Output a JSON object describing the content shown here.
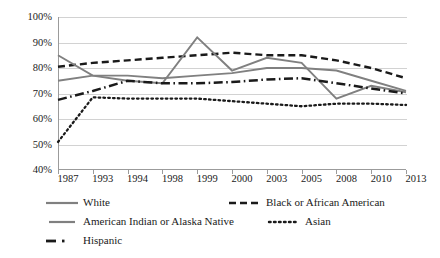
{
  "chart_data": {
    "type": "line",
    "title": "",
    "xlabel": "",
    "ylabel": "",
    "ylim": [
      40,
      100
    ],
    "ytick_labels": [
      "100%",
      "90%",
      "80%",
      "70%",
      "60%",
      "50%",
      "40%"
    ],
    "ytick_values": [
      100,
      90,
      80,
      70,
      60,
      50,
      40
    ],
    "grid": true,
    "legend_position": "bottom",
    "categories": [
      "1987",
      "1993",
      "1994",
      "1998",
      "1999",
      "2000",
      "2003",
      "2005",
      "2008",
      "2010",
      "2013"
    ],
    "series": [
      {
        "name": "White",
        "style": "solid",
        "color": "#808080",
        "values": [
          75,
          77,
          77,
          76,
          77,
          78,
          80,
          80,
          79,
          75,
          71
        ]
      },
      {
        "name": "Black or African American",
        "style": "dashed",
        "color": "#1a1a1a",
        "values": [
          80.5,
          82,
          83,
          84,
          85,
          86,
          85,
          85,
          83,
          80,
          76
        ]
      },
      {
        "name": "American Indian or Alaska Native",
        "style": "solid",
        "color": "#808080",
        "values": [
          85,
          77,
          75,
          74,
          92,
          79,
          84,
          82,
          68,
          73,
          70.5
        ]
      },
      {
        "name": "Asian",
        "style": "dotted",
        "color": "#1a1a1a",
        "values": [
          51,
          68.5,
          68,
          68,
          68,
          67,
          66,
          65,
          66,
          66,
          65.5
        ]
      },
      {
        "name": "Hispanic",
        "style": "dashdot",
        "color": "#1a1a1a",
        "values": [
          67.5,
          71,
          75,
          74,
          74,
          74.5,
          75.5,
          76,
          74,
          72,
          70
        ]
      }
    ]
  },
  "legend": {
    "items": [
      {
        "label": "White",
        "icon": "solid-line-swatch"
      },
      {
        "label": "Black or African American",
        "icon": "dashed-line-swatch"
      },
      {
        "label": "American Indian or Alaska Native",
        "icon": "solid-line-swatch"
      },
      {
        "label": "Asian",
        "icon": "dotted-line-swatch"
      },
      {
        "label": "Hispanic",
        "icon": "dashdot-line-swatch"
      }
    ]
  },
  "colors": {
    "gray_series": "#808080",
    "dark_series": "#1a1a1a",
    "gridline": "#d2d2d2",
    "axis": "#9b9b9b",
    "background": "#ffffff"
  }
}
